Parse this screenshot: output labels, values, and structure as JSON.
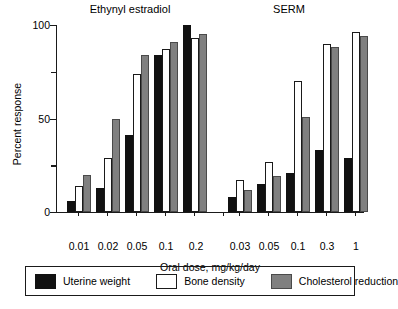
{
  "chart_data": {
    "type": "bar",
    "title": "",
    "xlabel": "Oral dose, mg/kg/day",
    "ylabel": "Percent response",
    "ylim": [
      0,
      100
    ],
    "y_ticks_major": [
      0,
      50,
      100
    ],
    "y_ticks_minor": [
      25,
      75
    ],
    "y_tick_labels": [
      "0",
      "50",
      "100"
    ],
    "grid": false,
    "legend_position": "bottom",
    "panels": [
      {
        "name": "Ethynyl estradiol",
        "categories": [
          "0.01",
          "0.02",
          "0.05",
          "0.1",
          "0.2"
        ],
        "series": [
          {
            "name": "Uterine weight",
            "values": [
              6,
              13,
              41,
              84,
              100
            ]
          },
          {
            "name": "Bone density",
            "values": [
              14,
              29,
              74,
              87,
              93
            ]
          },
          {
            "name": "Cholesterol reduction",
            "values": [
              20,
              50,
              84,
              91,
              95
            ]
          }
        ]
      },
      {
        "name": "SERM",
        "categories": [
          "0.03",
          "0.05",
          "0.1",
          "0.3",
          "1"
        ],
        "series": [
          {
            "name": "Uterine weight",
            "values": [
              8,
              15,
              21,
              33,
              29
            ]
          },
          {
            "name": "Bone density",
            "values": [
              17,
              27,
              70,
              90,
              96
            ]
          },
          {
            "name": "Cholesterol reduction",
            "values": [
              12,
              19,
              51,
              88,
              94
            ]
          }
        ]
      }
    ],
    "series_colors": {
      "Uterine weight": "#111111",
      "Bone density": "#ffffff",
      "Cholesterol reduction": "#808080"
    },
    "legend": [
      {
        "label": "Uterine weight",
        "swatch": "uterine"
      },
      {
        "label": "Bone density",
        "swatch": "bone"
      },
      {
        "label": "Cholesterol reduction",
        "swatch": "chol"
      }
    ]
  }
}
